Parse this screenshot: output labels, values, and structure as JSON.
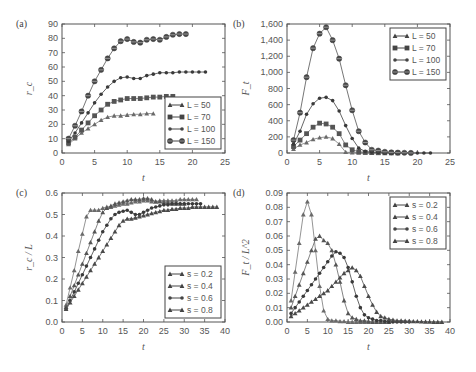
{
  "chart_data": [
    {
      "type": "line",
      "panel_label": "(a)",
      "xlabel": "t",
      "ylabel": "r_c",
      "xlim": [
        0,
        25
      ],
      "ylim": [
        0,
        90
      ],
      "xticks": [
        0,
        5,
        10,
        15,
        20,
        25
      ],
      "yticks": [
        0,
        10,
        20,
        30,
        40,
        50,
        60,
        70,
        80,
        90
      ],
      "ytick_labels": [
        "0",
        "10",
        "20",
        "30",
        "40",
        "50",
        "60",
        "70",
        "80",
        "90"
      ],
      "legend_position": "bottom-right",
      "series": [
        {
          "name": "L = 50",
          "marker": "triangle",
          "x": [
            1,
            2,
            3,
            4,
            5,
            6,
            7,
            8,
            9,
            10,
            11,
            12,
            13,
            14
          ],
          "y": [
            6,
            10,
            14,
            17,
            20,
            23,
            25,
            26,
            26,
            26.5,
            27,
            27,
            27.5,
            27.5
          ]
        },
        {
          "name": "L = 70",
          "marker": "square",
          "x": [
            1,
            2,
            3,
            4,
            5,
            6,
            7,
            8,
            9,
            10,
            11,
            12,
            13,
            14,
            15,
            16,
            17
          ],
          "y": [
            7,
            11,
            16,
            21,
            26,
            30,
            34,
            36,
            37,
            38,
            38,
            38,
            38.5,
            39,
            39,
            39.5,
            39.5
          ]
        },
        {
          "name": "L = 100",
          "marker": "dot",
          "x": [
            1,
            2,
            3,
            4,
            5,
            6,
            7,
            8,
            9,
            10,
            11,
            12,
            13,
            14,
            15,
            16,
            17,
            18,
            19,
            20,
            21,
            22
          ],
          "y": [
            8,
            14,
            21,
            28,
            35,
            41,
            46,
            50,
            52.5,
            53,
            52,
            52,
            54,
            55,
            56,
            56,
            56,
            56.5,
            56.5,
            56.5,
            56.5,
            56.5
          ]
        },
        {
          "name": "L = 150",
          "marker": "diamond",
          "x": [
            1,
            2,
            3,
            4,
            5,
            6,
            7,
            8,
            9,
            10,
            11,
            12,
            13,
            14,
            15,
            16,
            17,
            18,
            19
          ],
          "y": [
            10,
            19,
            29,
            40,
            50,
            58,
            66,
            73,
            78,
            79.5,
            77.5,
            77,
            79,
            79.5,
            79,
            81,
            82.5,
            83,
            83
          ]
        }
      ]
    },
    {
      "type": "line",
      "panel_label": "(b)",
      "xlabel": "t",
      "ylabel": "F_t",
      "xlim": [
        0,
        25
      ],
      "ylim": [
        0,
        1600
      ],
      "xticks": [
        0,
        5,
        10,
        15,
        20,
        25
      ],
      "yticks": [
        0,
        200,
        400,
        600,
        800,
        1000,
        1200,
        1400,
        1600
      ],
      "ytick_labels": [
        "0",
        "200",
        "400",
        "600",
        "800",
        "1,000",
        "1,200",
        "1,400",
        "1,600"
      ],
      "legend_position": "top-right",
      "series": [
        {
          "name": "L = 50",
          "marker": "triangle",
          "x": [
            1,
            2,
            3,
            4,
            5,
            6,
            7,
            8,
            9,
            10,
            11,
            12,
            13,
            14
          ],
          "y": [
            50,
            100,
            130,
            170,
            190,
            200,
            180,
            110,
            10,
            5,
            3,
            2,
            1,
            0
          ]
        },
        {
          "name": "L = 70",
          "marker": "square",
          "x": [
            1,
            2,
            3,
            4,
            5,
            6,
            7,
            8,
            9,
            10,
            11,
            12,
            13,
            14,
            15,
            16,
            17
          ],
          "y": [
            80,
            160,
            240,
            320,
            370,
            360,
            320,
            240,
            100,
            40,
            15,
            8,
            5,
            3,
            2,
            1,
            0
          ]
        },
        {
          "name": "L = 100",
          "marker": "dot",
          "x": [
            1,
            2,
            3,
            4,
            5,
            6,
            7,
            8,
            9,
            10,
            11,
            12,
            13,
            14,
            15,
            16,
            17,
            18,
            19,
            20,
            21,
            22
          ],
          "y": [
            110,
            270,
            480,
            610,
            680,
            690,
            650,
            520,
            340,
            180,
            60,
            20,
            10,
            6,
            4,
            3,
            2,
            1,
            1,
            0,
            0,
            0
          ]
        },
        {
          "name": "L = 150",
          "marker": "diamond",
          "x": [
            1,
            2,
            3,
            4,
            5,
            6,
            7,
            8,
            9,
            10,
            11,
            12,
            13,
            14,
            15,
            16,
            17,
            18,
            19
          ],
          "y": [
            160,
            500,
            940,
            1300,
            1480,
            1560,
            1400,
            1170,
            840,
            530,
            270,
            130,
            40,
            30,
            15,
            8,
            5,
            3,
            1
          ]
        }
      ]
    },
    {
      "type": "line",
      "panel_label": "(c)",
      "xlabel": "t",
      "ylabel": "r_c / L",
      "xlim": [
        0,
        40
      ],
      "ylim": [
        0,
        0.6
      ],
      "xticks": [
        0,
        5,
        10,
        15,
        20,
        25,
        30,
        35,
        40
      ],
      "yticks": [
        0,
        0.1,
        0.2,
        0.3,
        0.4,
        0.5,
        0.6
      ],
      "ytick_labels": [
        "0.0",
        "0.1",
        "0.2",
        "0.3",
        "0.4",
        "0.5",
        "0.6"
      ],
      "legend_position": "bottom-right",
      "series": [
        {
          "name": "s = 0.2",
          "marker": "triangle",
          "x": [
            1,
            2,
            3,
            4,
            5,
            6,
            7,
            8,
            9,
            10,
            11,
            12,
            13,
            14,
            15,
            16,
            17,
            18,
            19,
            20,
            21,
            22,
            23,
            24,
            25,
            26,
            27,
            28,
            29,
            30,
            31,
            32,
            33
          ],
          "y": [
            0.08,
            0.16,
            0.24,
            0.33,
            0.41,
            0.49,
            0.52,
            0.52,
            0.52,
            0.53,
            0.535,
            0.535,
            0.54,
            0.545,
            0.55,
            0.55,
            0.555,
            0.56,
            0.56,
            0.565,
            0.565,
            0.56,
            0.56,
            0.565,
            0.565,
            0.565,
            0.565,
            0.565,
            0.57,
            0.57,
            0.57,
            0.57,
            0.57
          ]
        },
        {
          "name": "s = 0.4",
          "marker": "triangle",
          "x": [
            1,
            2,
            3,
            4,
            5,
            6,
            7,
            8,
            9,
            10,
            11,
            12,
            13,
            14,
            15,
            16,
            17,
            18,
            19,
            20,
            21,
            22,
            23,
            24,
            25,
            26,
            27,
            28,
            29,
            30
          ],
          "y": [
            0.07,
            0.12,
            0.17,
            0.22,
            0.27,
            0.32,
            0.37,
            0.42,
            0.47,
            0.51,
            0.53,
            0.54,
            0.55,
            0.555,
            0.56,
            0.565,
            0.57,
            0.57,
            0.57,
            0.575,
            0.575,
            0.57,
            0.56,
            0.56,
            0.555,
            0.555,
            0.55,
            0.55,
            0.55,
            0.55
          ]
        },
        {
          "name": "s = 0.6",
          "marker": "dot",
          "x": [
            1,
            2,
            3,
            4,
            5,
            6,
            7,
            8,
            9,
            10,
            11,
            12,
            13,
            14,
            15,
            16,
            17,
            18,
            19,
            20,
            21,
            22,
            23,
            24,
            25,
            26,
            27,
            28,
            29,
            30,
            31,
            32,
            33,
            34
          ],
          "y": [
            0.06,
            0.1,
            0.14,
            0.18,
            0.22,
            0.26,
            0.3,
            0.34,
            0.38,
            0.42,
            0.45,
            0.48,
            0.5,
            0.51,
            0.515,
            0.52,
            0.51,
            0.5,
            0.5,
            0.51,
            0.52,
            0.53,
            0.535,
            0.54,
            0.545,
            0.545,
            0.55,
            0.55,
            0.55,
            0.55,
            0.55,
            0.55,
            0.55,
            0.55
          ]
        },
        {
          "name": "s = 0.8",
          "marker": "triangle",
          "x": [
            1,
            2,
            3,
            4,
            5,
            6,
            7,
            8,
            9,
            10,
            11,
            12,
            13,
            14,
            15,
            16,
            17,
            18,
            19,
            20,
            21,
            22,
            23,
            24,
            25,
            26,
            27,
            28,
            29,
            30,
            31,
            32,
            33,
            34,
            35,
            36,
            37,
            38
          ],
          "y": [
            0.06,
            0.09,
            0.12,
            0.15,
            0.18,
            0.21,
            0.24,
            0.27,
            0.3,
            0.33,
            0.36,
            0.39,
            0.42,
            0.45,
            0.47,
            0.48,
            0.48,
            0.485,
            0.49,
            0.495,
            0.5,
            0.505,
            0.51,
            0.515,
            0.52,
            0.52,
            0.525,
            0.525,
            0.53,
            0.53,
            0.53,
            0.535,
            0.535,
            0.535,
            0.535,
            0.535,
            0.535,
            0.535
          ]
        }
      ]
    },
    {
      "type": "line",
      "panel_label": "(d)",
      "xlabel": "t",
      "ylabel": "F_t / L^2",
      "xlim": [
        0,
        40
      ],
      "ylim": [
        0,
        0.09
      ],
      "xticks": [
        0,
        5,
        10,
        15,
        20,
        25,
        30,
        35,
        40
      ],
      "yticks": [
        0,
        0.01,
        0.02,
        0.03,
        0.04,
        0.05,
        0.06,
        0.07,
        0.08,
        0.09
      ],
      "ytick_labels": [
        "0.00",
        "0.01",
        "0.02",
        "0.03",
        "0.04",
        "0.05",
        "0.06",
        "0.07",
        "0.08",
        "0.09"
      ],
      "legend_position": "top-right",
      "series": [
        {
          "name": "s = 0.2",
          "marker": "triangle",
          "x": [
            1,
            2,
            3,
            4,
            5,
            6,
            7,
            8,
            9,
            10,
            11,
            12,
            13,
            14,
            15,
            16,
            17,
            18,
            19,
            20
          ],
          "y": [
            0.015,
            0.035,
            0.055,
            0.075,
            0.084,
            0.075,
            0.05,
            0.025,
            0.008,
            0.002,
            0.001,
            0.001,
            0.0005,
            0.0005,
            0,
            0,
            0,
            0,
            0,
            0
          ]
        },
        {
          "name": "s = 0.4",
          "marker": "triangle",
          "x": [
            1,
            2,
            3,
            4,
            5,
            6,
            7,
            8,
            9,
            10,
            11,
            12,
            13,
            14,
            15,
            16,
            17,
            18,
            19,
            20,
            21,
            22,
            23,
            24,
            25
          ],
          "y": [
            0.01,
            0.018,
            0.026,
            0.034,
            0.042,
            0.05,
            0.058,
            0.06,
            0.057,
            0.055,
            0.05,
            0.04,
            0.028,
            0.015,
            0.006,
            0.003,
            0.002,
            0.001,
            0.001,
            0.0005,
            0,
            0,
            0,
            0,
            0
          ]
        },
        {
          "name": "s = 0.6",
          "marker": "dot",
          "x": [
            1,
            2,
            3,
            4,
            5,
            6,
            7,
            8,
            9,
            10,
            11,
            12,
            13,
            14,
            15,
            16,
            17,
            18,
            19,
            20,
            21,
            22,
            23,
            24,
            25,
            26,
            27,
            28,
            29,
            30
          ],
          "y": [
            0.006,
            0.01,
            0.014,
            0.018,
            0.022,
            0.026,
            0.03,
            0.034,
            0.038,
            0.042,
            0.046,
            0.049,
            0.048,
            0.045,
            0.038,
            0.028,
            0.018,
            0.01,
            0.005,
            0.003,
            0.002,
            0.001,
            0.001,
            0.0005,
            0,
            0,
            0,
            0,
            0,
            0
          ]
        },
        {
          "name": "s = 0.8",
          "marker": "triangle",
          "x": [
            1,
            2,
            3,
            4,
            5,
            6,
            7,
            8,
            9,
            10,
            11,
            12,
            13,
            14,
            15,
            16,
            17,
            18,
            19,
            20,
            21,
            22,
            23,
            24,
            25,
            26,
            27,
            28,
            29,
            30,
            31,
            32,
            33,
            34,
            35,
            36,
            37,
            38
          ],
          "y": [
            0.004,
            0.006,
            0.008,
            0.01,
            0.012,
            0.014,
            0.016,
            0.018,
            0.02,
            0.022,
            0.025,
            0.028,
            0.031,
            0.034,
            0.036,
            0.038,
            0.036,
            0.032,
            0.025,
            0.018,
            0.012,
            0.007,
            0.004,
            0.003,
            0.002,
            0.0015,
            0.001,
            0.001,
            0.0008,
            0.0006,
            0.0005,
            0.0004,
            0.0003,
            0.0002,
            0.0001,
            0,
            0,
            0
          ]
        }
      ]
    }
  ]
}
